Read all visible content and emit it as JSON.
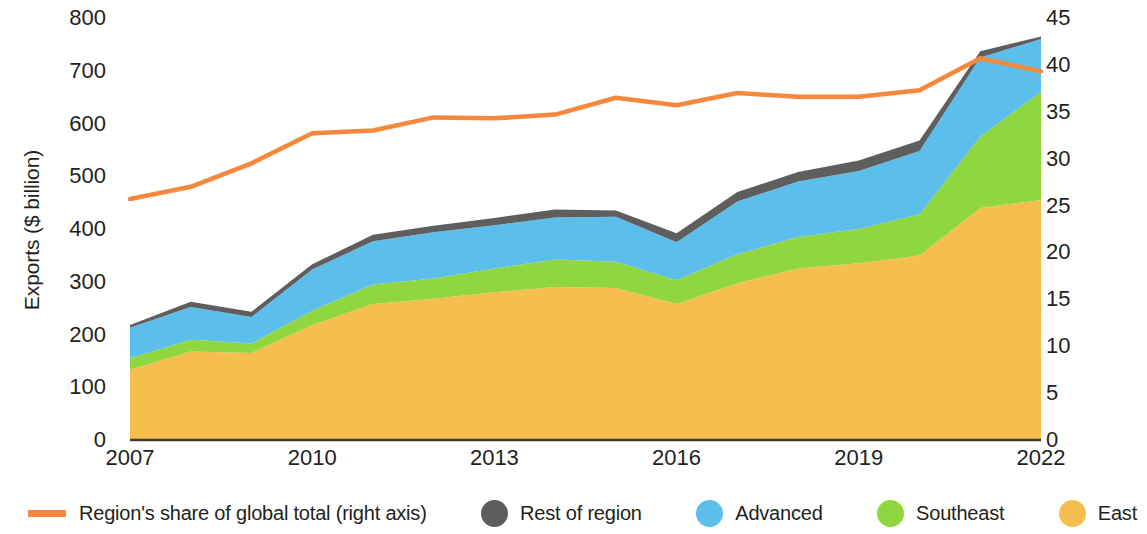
{
  "axes": {
    "left_title": "Exports ($ billion)",
    "right_title": "Asia and Pacific share of global total (%)",
    "left_ticks": [
      "800",
      "700",
      "600",
      "500",
      "400",
      "300",
      "200",
      "100",
      "0"
    ],
    "right_ticks": [
      "45",
      "40",
      "35",
      "30",
      "25",
      "20",
      "15",
      "10",
      "5",
      "0"
    ],
    "x_ticks": [
      "2007",
      "2010",
      "2013",
      "2016",
      "2019",
      "2022"
    ]
  },
  "legend": {
    "items": [
      {
        "label": "Region's share of global total (right axis)",
        "marker": "line",
        "color": "#F5883C",
        "name": "legend-region-share"
      },
      {
        "label": "Rest of region",
        "marker": "dot",
        "color": "#5E5E5E",
        "name": "legend-rest-of-region"
      },
      {
        "label": "Advanced",
        "marker": "dot",
        "color": "#5CBEEA",
        "name": "legend-advanced"
      },
      {
        "label": "Southeast",
        "marker": "dot",
        "color": "#8FD63F",
        "name": "legend-southeast"
      },
      {
        "label": "East",
        "marker": "dot",
        "color": "#F6BE4F",
        "name": "legend-east"
      }
    ]
  },
  "chart_data": {
    "type": "area",
    "title": "",
    "xlabel": "",
    "ylabel": "Exports ($ billion)",
    "y2label": "Asia and Pacific share of global total (%)",
    "ylim": [
      0,
      800
    ],
    "y2lim": [
      0,
      45
    ],
    "xlim": [
      2007,
      2022
    ],
    "grid": false,
    "legend_position": "bottom",
    "x": [
      2007,
      2008,
      2009,
      2010,
      2011,
      2012,
      2013,
      2014,
      2015,
      2016,
      2017,
      2018,
      2019,
      2020,
      2021,
      2022
    ],
    "stacked_series": [
      {
        "name": "East",
        "color": "#F6BE4F",
        "values": [
          133,
          168,
          165,
          218,
          258,
          268,
          280,
          290,
          288,
          258,
          297,
          325,
          335,
          350,
          440,
          455
        ]
      },
      {
        "name": "Southeast",
        "color": "#8FD63F",
        "values": [
          22,
          22,
          18,
          27,
          37,
          38,
          45,
          52,
          50,
          45,
          55,
          60,
          65,
          78,
          135,
          205
        ]
      },
      {
        "name": "Advanced",
        "color": "#5CBEEA",
        "values": [
          58,
          62,
          50,
          78,
          82,
          88,
          82,
          80,
          85,
          72,
          100,
          105,
          110,
          120,
          150,
          100
        ]
      },
      {
        "name": "Rest of region",
        "color": "#5E5E5E",
        "values": [
          5,
          10,
          10,
          10,
          12,
          12,
          14,
          15,
          12,
          17,
          18,
          18,
          20,
          20,
          12,
          5
        ]
      }
    ],
    "line_series": {
      "name": "Region's share of global total (right axis)",
      "color": "#F5883C",
      "axis": "right",
      "values": [
        25.7,
        27.0,
        29.5,
        32.7,
        33.0,
        34.4,
        34.3,
        34.7,
        36.5,
        35.7,
        37.0,
        36.6,
        36.6,
        37.3,
        40.7,
        39.3
      ]
    }
  }
}
